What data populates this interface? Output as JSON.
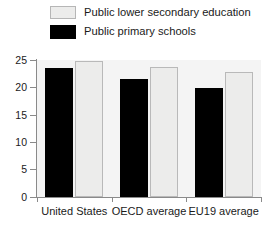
{
  "chart_data": {
    "type": "bar",
    "title": "",
    "subtitle": "",
    "xlabel": "",
    "ylabel": "",
    "ylim": [
      0,
      25
    ],
    "yticks": [
      0,
      5,
      10,
      15,
      20,
      25
    ],
    "ytick_labels": [
      "0",
      "5",
      "10",
      "15",
      "20",
      "25"
    ],
    "grid": false,
    "legend_position": "top",
    "categories": [
      "United States",
      "OECD average",
      "EU19 average"
    ],
    "series": [
      {
        "name": "Public primary schools",
        "color": "#000000",
        "values": [
          23.5,
          21.6,
          19.8
        ]
      },
      {
        "name": "Public lower secondary education",
        "color": "#ececeb",
        "values": [
          24.8,
          23.7,
          22.8
        ]
      }
    ]
  },
  "legend": {
    "items": [
      {
        "label": "Public lower secondary education",
        "swatch": "light"
      },
      {
        "label": "Public primary schools",
        "swatch": "dark"
      }
    ]
  },
  "axes": {
    "y_tick_labels": [
      "25",
      "20",
      "15",
      "10",
      "5",
      "0"
    ],
    "x_tick_labels": [
      "United States",
      "OECD average",
      "EU19 average"
    ]
  },
  "colors": {
    "dark_series": "#000000",
    "light_series": "#ececeb",
    "light_series_border": "#b9b9b9",
    "plot_background": "#f4f4f4",
    "axis": "#8a8a8a",
    "text": "#1a1a1a"
  }
}
